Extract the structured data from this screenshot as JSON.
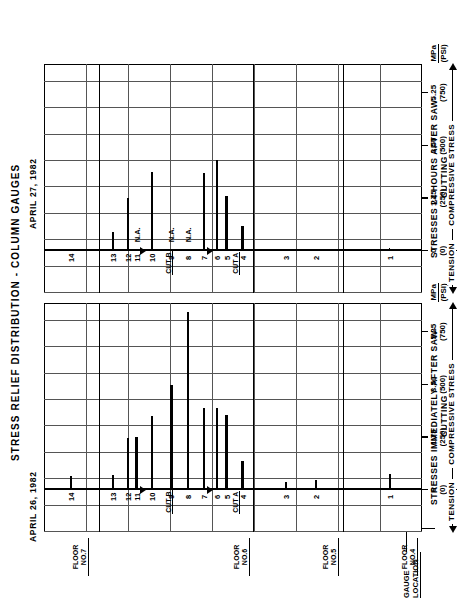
{
  "figure": {
    "main_title": "STRESS  RELIEF  DISTRIBUTION - COLUMN  GAUGES",
    "gauge_location_label": "GAUGE\nLOCATION",
    "na_label": "N.A."
  },
  "axis": {
    "tick_values_mpa": [
      "0",
      "1.75",
      "3.50",
      "5.25"
    ],
    "tick_values_psi": [
      "(0)",
      "(250)",
      "(500)",
      "(750)"
    ],
    "unit_top": "MPa",
    "unit_bottom": "(PSI)",
    "compressive_label": "COMPRESSIVE  STRESS",
    "tension_label": "TENSION",
    "min_mpa": 0,
    "max_mpa": 6.2,
    "neg_mpa": -1.4
  },
  "floors": [
    {
      "name": "FLOOR\nNO.7"
    },
    {
      "name": "FLOOR\nNO.6"
    },
    {
      "name": "FLOOR\nNO.5"
    },
    {
      "name": "FLOOR\nNO.4"
    }
  ],
  "cuts": [
    {
      "label": "CUT B"
    },
    {
      "label": "CUT A"
    }
  ],
  "chart_data": {
    "type": "bar",
    "title": "STRESS RELIEF DISTRIBUTION - COLUMN GAUGES",
    "xlabel": "COMPRESSIVE STRESS  MPa (PSI)",
    "ylabel": "GAUGE LOCATION",
    "xlim": [
      0,
      6.2
    ],
    "grid": true,
    "legend": "none",
    "categories": [
      "14",
      "13",
      "12",
      "11",
      "10",
      "9",
      "8",
      "7",
      "6",
      "5",
      "4",
      "3",
      "2",
      "1"
    ],
    "series": [
      {
        "name": "STRESSES IMMEDIATELY AFTER SAW-CUTTING",
        "date": "APRIL 26, 1982",
        "panel_caption": "STRESSES  IMMEDIATELY  AFTER  SAW-\nCUTTING",
        "units": "MPa",
        "values": [
          0.47,
          0.5,
          1.73,
          1.75,
          2.46,
          3.47,
          5.9,
          2.72,
          2.72,
          2.47,
          0.97,
          0.25,
          0.34,
          0.53
        ]
      },
      {
        "name": "STRESSES 24 HOURS AFTER SAW-CUTTING",
        "date": "APRIL 27, 1982",
        "panel_caption": "STRESSES  24  HOURS  AFTER  SAW-\nCUTTING",
        "units": "MPa",
        "values": [
          0.06,
          0.62,
          1.74,
          null,
          2.63,
          null,
          null,
          2.6,
          3.02,
          1.82,
          0.82,
          0.05,
          0.05,
          0.1
        ],
        "na_categories": [
          "9",
          "8"
        ]
      }
    ]
  }
}
